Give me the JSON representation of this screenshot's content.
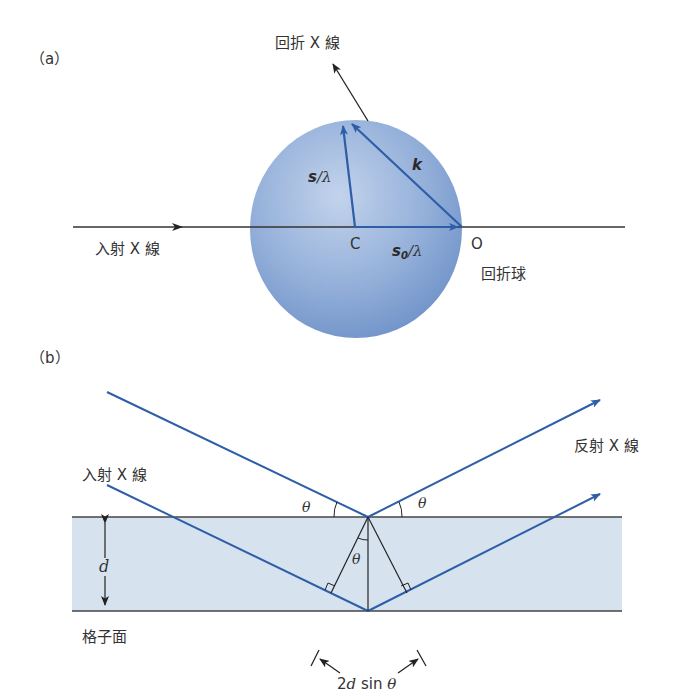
{
  "panel_a": {
    "label": "（a）",
    "diffracted_xray": "回折 X 線",
    "incident_xray": "入射 X 線",
    "sphere_label": "回折球",
    "point_c": "C",
    "point_o": "O",
    "vec_s": "s",
    "vec_s_suffix": "/λ",
    "vec_s0": "s",
    "vec_s0_sub": "0",
    "vec_s0_suffix": "/λ",
    "vec_k": "k"
  },
  "panel_b": {
    "label": "（b）",
    "incident_xray": "入射 X 線",
    "reflected_xray": "反射 X 線",
    "lattice_plane": "格子面",
    "theta": "θ",
    "spacing": "d",
    "path_diff_prefix": "2",
    "path_diff_d": "d",
    "path_diff_sin": " sin ",
    "path_diff_theta": "θ"
  },
  "colors": {
    "ray_blue": "#2f5ea8",
    "sphere_fill": "#8eaad6",
    "band_fill": "#d6e3ef",
    "line_dark": "#333333"
  }
}
